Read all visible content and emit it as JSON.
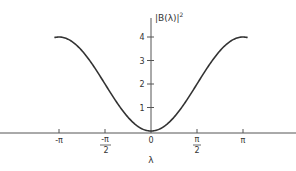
{
  "chart_data": {
    "type": "line",
    "title": "",
    "xlabel": "λ",
    "ylabel": "|B(λ)|²",
    "x_ticks": [
      {
        "value": -3.14159,
        "label": "-π"
      },
      {
        "value": -1.5708,
        "label": "-π/2"
      },
      {
        "value": 0,
        "label": "0"
      },
      {
        "value": 1.5708,
        "label": "π/2"
      },
      {
        "value": 3.14159,
        "label": "π"
      }
    ],
    "y_ticks": [
      1,
      2,
      3,
      4
    ],
    "xlim": [
      -3.3,
      3.3
    ],
    "ylim": [
      0,
      4.5
    ],
    "grid": false,
    "legend": null,
    "series": [
      {
        "name": "|B(λ)|²",
        "x": [
          -3.3,
          -3.14159,
          -2.5,
          -2.0,
          -1.5708,
          -1.0,
          -0.5,
          0,
          0.5,
          1.0,
          1.5708,
          2.0,
          2.5,
          3.14159,
          3.3
        ],
        "y": [
          3.97,
          4.0,
          3.6,
          2.83,
          2.0,
          0.92,
          0.24,
          0,
          0.24,
          0.92,
          2.0,
          2.83,
          3.6,
          4.0,
          3.97
        ]
      }
    ],
    "formula": "2(1 - cos λ)"
  },
  "labels": {
    "ylabel_text": "|B(λ)|",
    "ylabel_sup": "2",
    "xlabel_text": "λ",
    "ytick_1": "1",
    "ytick_2": "2",
    "ytick_3": "3",
    "ytick_4": "4",
    "xtick_neg_pi": "-π",
    "xtick_neg_half_pi_num": "-π",
    "xtick_neg_half_pi_den": "2",
    "xtick_zero": "0",
    "xtick_half_pi_num": "π",
    "xtick_half_pi_den": "2",
    "xtick_pi": "π"
  }
}
